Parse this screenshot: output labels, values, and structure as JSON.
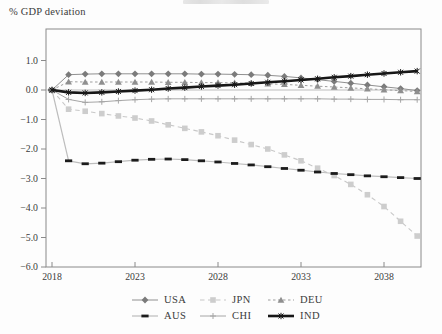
{
  "chart": {
    "ylabel": "% GDP deviation"
  },
  "chart_data": {
    "type": "line",
    "title": "",
    "ylabel": "% GDP deviation",
    "x_start": 2018,
    "x": [
      2018,
      2019,
      2020,
      2021,
      2022,
      2023,
      2024,
      2025,
      2026,
      2027,
      2028,
      2029,
      2030,
      2031,
      2032,
      2033,
      2034,
      2035,
      2036,
      2037,
      2038,
      2039,
      2040
    ],
    "xticks": [
      {
        "value": 2018,
        "label": "2018"
      },
      {
        "value": 2023,
        "label": "2023"
      },
      {
        "value": 2028,
        "label": "2028"
      },
      {
        "value": 2033,
        "label": "2033"
      },
      {
        "value": 2038,
        "label": "2038"
      }
    ],
    "yticks": [
      {
        "value": 1.0,
        "label": "1.0"
      },
      {
        "value": 0.0,
        "label": "0.0"
      },
      {
        "value": -1.0,
        "label": "−1.0"
      },
      {
        "value": -2.0,
        "label": "−2.0"
      },
      {
        "value": -3.0,
        "label": "−3.0"
      },
      {
        "value": -4.0,
        "label": "−4.0"
      },
      {
        "value": -5.0,
        "label": "−5.0"
      },
      {
        "value": -6.0,
        "label": "−6.0"
      }
    ],
    "ylim": [
      -6.0,
      2.05
    ],
    "xlim": [
      2017.65,
      2040.3
    ],
    "grid": false,
    "zero_line": true,
    "legend_position": "bottom",
    "frame_color": "#8a8a8a",
    "zero_line_color": "#b5b5b5",
    "tick_text_color": "#3b3b3b",
    "series": [
      {
        "name": "USA",
        "line_color": "#909090",
        "marker_color": "#7b7b7b",
        "marker": "diamond",
        "dash": "",
        "width": 1,
        "values": [
          0,
          0.52,
          0.54,
          0.55,
          0.55,
          0.55,
          0.55,
          0.55,
          0.55,
          0.54,
          0.54,
          0.53,
          0.52,
          0.5,
          0.46,
          0.41,
          0.35,
          0.29,
          0.23,
          0.17,
          0.11,
          0.05,
          -0.02
        ]
      },
      {
        "name": "JPN",
        "line_color": "#c8c8c8",
        "marker_color": "#cdcdcd",
        "marker": "square",
        "dash": "4.5,3.5",
        "width": 1.1,
        "values": [
          0,
          -0.65,
          -0.72,
          -0.8,
          -0.88,
          -0.95,
          -1.05,
          -1.18,
          -1.3,
          -1.42,
          -1.55,
          -1.7,
          -1.85,
          -2.0,
          -2.2,
          -2.4,
          -2.65,
          -2.9,
          -3.2,
          -3.55,
          -3.95,
          -4.45,
          -4.95
        ]
      },
      {
        "name": "DEU",
        "line_color": "#9d9d9d",
        "marker_color": "#8f8f8f",
        "marker": "triangle",
        "dash": "2.5,2.5",
        "width": 1,
        "values": [
          0,
          0.28,
          0.27,
          0.27,
          0.27,
          0.27,
          0.27,
          0.26,
          0.26,
          0.25,
          0.25,
          0.24,
          0.23,
          0.21,
          0.19,
          0.16,
          0.13,
          0.1,
          0.07,
          0.04,
          0.01,
          -0.02,
          -0.05
        ]
      },
      {
        "name": "AUS",
        "line_color": "#bdbdbd",
        "marker_color": "#1c1c1c",
        "marker": "hdash",
        "dash": "",
        "width": 1.2,
        "values": [
          0,
          -2.4,
          -2.5,
          -2.48,
          -2.43,
          -2.38,
          -2.35,
          -2.34,
          -2.36,
          -2.4,
          -2.44,
          -2.49,
          -2.54,
          -2.6,
          -2.66,
          -2.72,
          -2.78,
          -2.83,
          -2.87,
          -2.91,
          -2.94,
          -2.97,
          -3.0
        ]
      },
      {
        "name": "CHI",
        "line_color": "#a6a6a6",
        "marker_color": "#a6a6a6",
        "marker": "plus",
        "dash": "",
        "width": 1,
        "values": [
          0,
          -0.32,
          -0.42,
          -0.4,
          -0.36,
          -0.33,
          -0.31,
          -0.3,
          -0.3,
          -0.3,
          -0.3,
          -0.3,
          -0.3,
          -0.3,
          -0.3,
          -0.3,
          -0.3,
          -0.31,
          -0.31,
          -0.32,
          -0.32,
          -0.33,
          -0.33
        ]
      },
      {
        "name": "IND",
        "line_color": "#171717",
        "marker_color": "#171717",
        "marker": "xplus",
        "dash": "",
        "width": 2.6,
        "values": [
          0,
          -0.08,
          -0.1,
          -0.08,
          -0.05,
          -0.02,
          0.01,
          0.05,
          0.08,
          0.12,
          0.15,
          0.18,
          0.22,
          0.26,
          0.3,
          0.34,
          0.38,
          0.43,
          0.47,
          0.52,
          0.56,
          0.6,
          0.64
        ]
      }
    ],
    "legend_rows": [
      [
        "USA",
        "JPN",
        "DEU"
      ],
      [
        "AUS",
        "CHI",
        "IND"
      ]
    ]
  }
}
